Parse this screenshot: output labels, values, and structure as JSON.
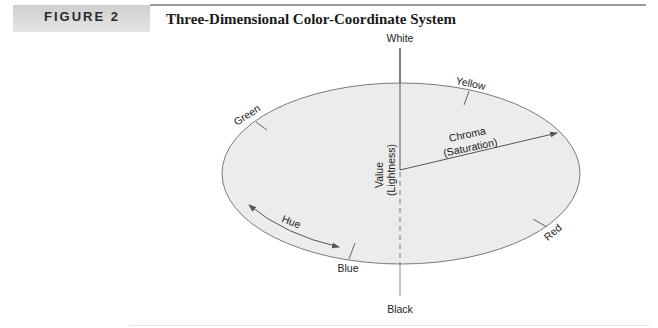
{
  "figure": {
    "label": "FIGURE 2",
    "title": "Three-Dimensional Color-Coordinate System"
  },
  "diagram": {
    "axis_top_label": "White",
    "axis_bottom_label": "Black",
    "value_axis_label_line1": "Value",
    "value_axis_label_line2": "(Lightness)",
    "chroma_label_line1": "Chroma",
    "chroma_label_line2": "(Saturation)",
    "hue_label": "Hue",
    "hue_points": {
      "green": "Green",
      "yellow": "Yellow",
      "red": "Red",
      "blue": "Blue"
    },
    "colors": {
      "ellipse_fill": "#ececec",
      "ellipse_stroke": "#7a7a7a",
      "line": "#555555"
    }
  }
}
